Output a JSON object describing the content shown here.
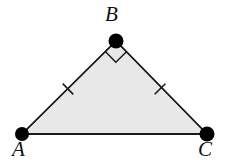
{
  "figure": {
    "type": "geometry-diagram",
    "shape": "isosceles-right-triangle",
    "background_color": "#ffffff",
    "fill_color": "#e8e8e8",
    "stroke_color": "#1a1a1a",
    "vertex_dot_color": "#000000",
    "stroke_width": 1.4,
    "vertex_dot_radius": 7,
    "vertices": [
      {
        "name": "A",
        "label": "A",
        "x": 22,
        "y": 134,
        "label_x": 12,
        "label_y": 139
      },
      {
        "name": "B",
        "label": "B",
        "x": 116,
        "y": 41,
        "label_x": 105,
        "label_y": 4
      },
      {
        "name": "C",
        "label": "C",
        "x": 207,
        "y": 134,
        "label_x": 198,
        "label_y": 139
      }
    ],
    "sides": [
      {
        "name": "AB",
        "from": "A",
        "to": "B",
        "tick_marks": 1,
        "tick_center_x": 68,
        "tick_center_y": 89
      },
      {
        "name": "BC",
        "from": "B",
        "to": "C",
        "tick_marks": 1,
        "tick_center_x": 160,
        "tick_center_y": 89
      },
      {
        "name": "AC",
        "from": "A",
        "to": "C",
        "tick_marks": 0
      }
    ],
    "angle_markers": [
      {
        "name": "right-angle-at-B",
        "at_vertex": "B",
        "marker_shape": "square",
        "degrees": 90,
        "size": 15
      }
    ],
    "tick_mark": {
      "length": 15,
      "stroke_width": 1.4,
      "orientation": "perpendicular-to-side"
    }
  },
  "labels": {
    "a": "A",
    "b": "B",
    "c": "C"
  }
}
